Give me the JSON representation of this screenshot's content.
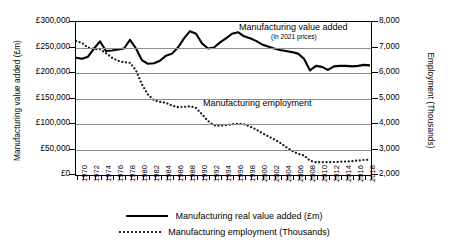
{
  "chart_data": {
    "type": "line",
    "title": "",
    "xlabel": "",
    "ylabel": "Manufacturing value added (£m)",
    "y2label": "Employment (Thousands)",
    "ylim": [
      0,
      300000
    ],
    "y2lim": [
      2000,
      8000
    ],
    "xlim": [
      1970,
      2019
    ],
    "grid": true,
    "legend_position": "bottom",
    "y_tick_labels": [
      "£300,000",
      "£250,000",
      "£200,000",
      "£150,000",
      "£100,000",
      "£50,000",
      "£0"
    ],
    "y_tick_values": [
      300000,
      250000,
      200000,
      150000,
      100000,
      50000,
      0
    ],
    "y2_tick_labels": [
      "8,000",
      "7,000",
      "6,000",
      "5,000",
      "4,000",
      "3,000",
      "2,000"
    ],
    "y2_tick_values": [
      8000,
      7000,
      6000,
      5000,
      4000,
      3000,
      2000
    ],
    "x_tick_labels": [
      "1970",
      "1972",
      "1974",
      "1976",
      "1978",
      "1980",
      "1982",
      "1984",
      "1986",
      "1988",
      "1990",
      "1992",
      "1994",
      "1996",
      "1998",
      "2000",
      "2002",
      "2004",
      "2006",
      "2008",
      "2010",
      "2012",
      "2014",
      "2016",
      "2018"
    ],
    "x_all_years": [
      1970,
      1971,
      1972,
      1973,
      1974,
      1975,
      1976,
      1977,
      1978,
      1979,
      1980,
      1981,
      1982,
      1983,
      1984,
      1985,
      1986,
      1987,
      1988,
      1989,
      1990,
      1991,
      1992,
      1993,
      1994,
      1995,
      1996,
      1997,
      1998,
      1999,
      2000,
      2001,
      2002,
      2003,
      2004,
      2005,
      2006,
      2007,
      2008,
      2009,
      2010,
      2011,
      2012,
      2013,
      2014,
      2015,
      2016,
      2017,
      2018,
      2019
    ],
    "series": [
      {
        "name": "Manufacturing real value added (£m)",
        "axis": "left",
        "style": "solid",
        "color": "#000000",
        "values": [
          230000,
          228000,
          232000,
          248000,
          262000,
          243000,
          244000,
          246000,
          248000,
          265000,
          248000,
          225000,
          218000,
          219000,
          224000,
          234000,
          238000,
          250000,
          268000,
          282000,
          277000,
          258000,
          248000,
          250000,
          260000,
          268000,
          277000,
          280000,
          272000,
          268000,
          263000,
          256000,
          252000,
          248000,
          245000,
          243000,
          241000,
          238000,
          228000,
          205000,
          214000,
          212000,
          206000,
          213000,
          214000,
          214000,
          213000,
          214000,
          216000,
          215000
        ]
      },
      {
        "name": "Manufacturing employment (Thousands)",
        "axis": "right",
        "style": "dotted",
        "color": "#1a1a1a",
        "values": [
          7250,
          7180,
          7000,
          6940,
          6930,
          6780,
          6600,
          6480,
          6420,
          6400,
          6100,
          5550,
          5150,
          4930,
          4870,
          4830,
          4720,
          4660,
          4670,
          4700,
          4630,
          4380,
          4120,
          3950,
          3930,
          3960,
          3990,
          4010,
          3990,
          3900,
          3790,
          3650,
          3520,
          3400,
          3270,
          3100,
          2950,
          2830,
          2770,
          2560,
          2500,
          2510,
          2500,
          2510,
          2520,
          2530,
          2540,
          2570,
          2590,
          2600
        ]
      }
    ],
    "annotations": [
      {
        "text": "Manufacturing value added",
        "sub": "(In 2021 prices)"
      },
      {
        "text": "Manufacturing employment",
        "sub": ""
      }
    ]
  },
  "legend": {
    "items": [
      {
        "label": "Manufacturing real value added (£m)",
        "style": "solid"
      },
      {
        "label": "Manufacturing employment (Thousands)",
        "style": "dotted"
      }
    ]
  }
}
